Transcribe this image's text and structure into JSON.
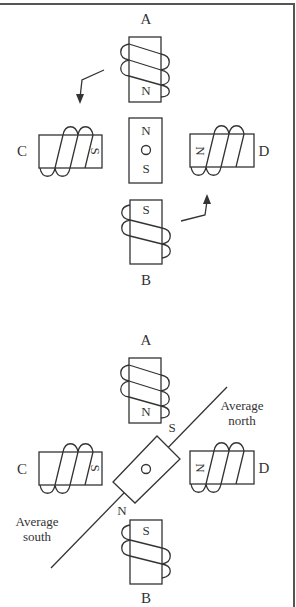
{
  "figure": {
    "colors": {
      "ink": "#333333",
      "frame": "#555555",
      "background": "#ffffff"
    },
    "top_diagram": {
      "coil_labels": {
        "a": "A",
        "b": "B",
        "c": "C",
        "d": "D"
      },
      "coil_poles": {
        "a": "N",
        "b": "S",
        "c": "S",
        "d": "N"
      },
      "rotor": {
        "north": "N",
        "pivot": "O",
        "south": "S",
        "orientation": "vertical"
      },
      "arrows": [
        {
          "name": "rotation-arrow-top-left",
          "direction": "down"
        },
        {
          "name": "rotation-arrow-bottom-right",
          "direction": "up"
        }
      ]
    },
    "bottom_diagram": {
      "coil_labels": {
        "a": "A",
        "b": "B",
        "c": "C",
        "d": "D"
      },
      "coil_poles": {
        "a": "N",
        "b": "S",
        "c": "S",
        "d": "N"
      },
      "rotor": {
        "north": "N",
        "pivot": "O",
        "south": "S",
        "orientation": "diagonal 45°"
      },
      "axis_labels": {
        "north_line1": "Average",
        "north_line2": "north",
        "south_line1": "Average",
        "south_line2": "south"
      }
    }
  }
}
